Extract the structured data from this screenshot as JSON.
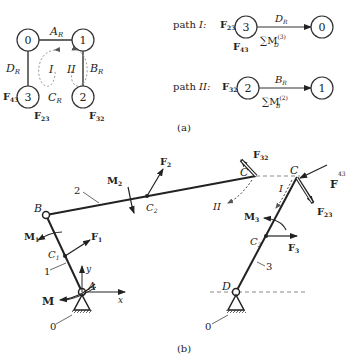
{
  "graph": {
    "nodes": [
      "0",
      "1",
      "2",
      "3"
    ],
    "edges": {
      "top": "A",
      "right": "B",
      "bottom": "C",
      "left": "D",
      "sub": "R"
    },
    "loops": [
      "I",
      "II"
    ],
    "node_labels": {
      "f43": "F",
      "f43_sub": "43",
      "f23": "F",
      "f23_sub": "23",
      "f32": "F",
      "f32_sub": "32"
    }
  },
  "path1": {
    "label": "path",
    "roman": "I:",
    "force": "F",
    "force_sub": "23",
    "from": "3",
    "to": "0",
    "edge": "D",
    "edge_sub": "R",
    "below": "F",
    "below_sub": "43",
    "sum": "∑M",
    "sum_sup": "(3)",
    "sum_sub": "D"
  },
  "path2": {
    "label": "path",
    "roman": "II:",
    "force": "F",
    "force_sub": "32",
    "from": "2",
    "to": "1",
    "edge": "B",
    "edge_sub": "R",
    "sum": "∑M",
    "sum_sup": "(2)",
    "sum_sub": "B"
  },
  "caption_a": "(a)",
  "caption_b": "(b)",
  "mech": {
    "points": {
      "A": "A",
      "B": "B",
      "C": "C",
      "D": "D",
      "C1": "C",
      "C1_sub": "1",
      "C2": "C",
      "C2_sub": "2",
      "C3": "C",
      "C3_sub": "3",
      "C_left": "C",
      "C_right": "C"
    },
    "links": {
      "l1": "1",
      "l2": "2",
      "l3": "3",
      "g0a": "0",
      "g0b": "0"
    },
    "forces": {
      "F1": "F",
      "F1_sub": "1",
      "F2": "F",
      "F2_sub": "2",
      "F3": "F",
      "F3_sub": "3",
      "F32": "F",
      "F32_sub": "32",
      "F23": "F",
      "F23_sub": "23",
      "F43": "F",
      "F43_sup": "43"
    },
    "moments": {
      "M": "M",
      "M1": "M",
      "M1_sub": "1",
      "M2": "M",
      "M2_sub": "2",
      "M3": "M",
      "M3_sub": "3"
    },
    "axes": {
      "x": "x",
      "y": "y"
    },
    "loops": {
      "I": "I",
      "II": "II"
    }
  }
}
